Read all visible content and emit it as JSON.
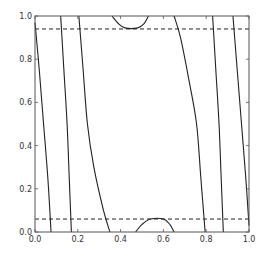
{
  "chart_data": {
    "type": "line",
    "title": "",
    "xlabel": "",
    "ylabel": "",
    "xlim": [
      0.0,
      1.0
    ],
    "ylim": [
      0.0,
      1.0
    ],
    "grid": false,
    "legend": null,
    "x_ticks": [
      "0.0",
      "0.2",
      "0.4",
      "0.6",
      "0.8",
      "1.0"
    ],
    "y_ticks": [
      "0.0",
      "0.2",
      "0.4",
      "0.6",
      "0.8",
      "1.0"
    ],
    "colors": {
      "line": "#222222",
      "frame": "#555555",
      "dashed": "#222222"
    },
    "dashed_lines": [
      {
        "orientation": "horizontal",
        "y": 0.94
      },
      {
        "orientation": "horizontal",
        "y": 0.06
      }
    ],
    "series": [
      {
        "name": "curve-1",
        "style": "solid",
        "points": [
          [
            0.0,
            0.97
          ],
          [
            0.02,
            0.75
          ],
          [
            0.04,
            0.5
          ],
          [
            0.06,
            0.25
          ],
          [
            0.075,
            0.0
          ]
        ]
      },
      {
        "name": "curve-2",
        "style": "solid",
        "points": [
          [
            0.12,
            1.0
          ],
          [
            0.135,
            0.75
          ],
          [
            0.15,
            0.5
          ],
          [
            0.16,
            0.25
          ],
          [
            0.17,
            0.0
          ]
        ]
      },
      {
        "name": "curve-3",
        "style": "solid",
        "points": [
          [
            0.205,
            1.0
          ],
          [
            0.225,
            0.75
          ],
          [
            0.245,
            0.5
          ],
          [
            0.275,
            0.3
          ],
          [
            0.32,
            0.1
          ],
          [
            0.35,
            0.0
          ]
        ]
      },
      {
        "name": "curve-4",
        "style": "solid",
        "points": [
          [
            0.65,
            1.0
          ],
          [
            0.68,
            0.9
          ],
          [
            0.72,
            0.7
          ],
          [
            0.755,
            0.5
          ],
          [
            0.775,
            0.25
          ],
          [
            0.795,
            0.0
          ]
        ]
      },
      {
        "name": "curve-5",
        "style": "solid",
        "points": [
          [
            0.83,
            1.0
          ],
          [
            0.845,
            0.75
          ],
          [
            0.86,
            0.5
          ],
          [
            0.87,
            0.25
          ],
          [
            0.88,
            0.0
          ]
        ]
      },
      {
        "name": "curve-6",
        "style": "solid",
        "points": [
          [
            0.925,
            1.0
          ],
          [
            0.945,
            0.75
          ],
          [
            0.965,
            0.5
          ],
          [
            0.985,
            0.25
          ],
          [
            1.0,
            0.03
          ]
        ]
      },
      {
        "name": "arc-top",
        "style": "solid",
        "points": [
          [
            0.36,
            1.0
          ],
          [
            0.39,
            0.965
          ],
          [
            0.42,
            0.945
          ],
          [
            0.48,
            0.945
          ],
          [
            0.51,
            0.965
          ],
          [
            0.53,
            1.0
          ]
        ]
      },
      {
        "name": "arc-bottom",
        "style": "solid",
        "points": [
          [
            0.47,
            0.0
          ],
          [
            0.5,
            0.035
          ],
          [
            0.54,
            0.06
          ],
          [
            0.6,
            0.06
          ],
          [
            0.63,
            0.035
          ],
          [
            0.65,
            0.0
          ]
        ]
      }
    ]
  }
}
